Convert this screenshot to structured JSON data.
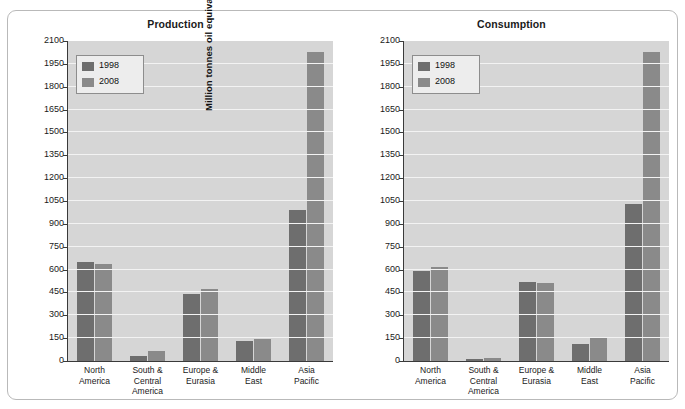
{
  "top_caption": "",
  "figure": {
    "panels": [
      {
        "title": "Production",
        "ylabel": "Million tonnes oil equivalent"
      },
      {
        "title": "Consumption",
        "ylabel": "Million tonnes oil equivalent"
      }
    ],
    "legend": {
      "items": [
        {
          "label": "1998",
          "color": "#6e6e6e"
        },
        {
          "label": "2008",
          "color": "#8a8a8a"
        }
      ]
    },
    "y_ticks": [
      "0",
      "150",
      "300",
      "450",
      "600",
      "750",
      "900",
      "1050",
      "1200",
      "1350",
      "1500",
      "1650",
      "1800",
      "1950",
      "2100"
    ],
    "categories": [
      "North\nAmerica",
      "South &\nCentral\nAmerica",
      "Europe &\nEurasia",
      "Middle\nEast",
      "Asia\nPacific"
    ]
  },
  "chart_data": [
    {
      "type": "bar",
      "title": "Production",
      "xlabel": "",
      "ylabel": "Million tonnes oil equivalent",
      "ylim": [
        0,
        2100
      ],
      "ytick_step": 150,
      "grid": true,
      "legend_position": "top-left",
      "categories": [
        "North America",
        "South & Central America",
        "Europe & Eurasia",
        "Middle East",
        "Asia Pacific"
      ],
      "series": [
        {
          "name": "1998",
          "color": "#6e6e6e",
          "values": [
            650,
            30,
            440,
            130,
            990
          ]
        },
        {
          "name": "2008",
          "color": "#8a8a8a",
          "values": [
            635,
            65,
            470,
            145,
            2030
          ]
        }
      ]
    },
    {
      "type": "bar",
      "title": "Consumption",
      "xlabel": "",
      "ylabel": "Million tonnes oil equivalent",
      "ylim": [
        0,
        2100
      ],
      "ytick_step": 150,
      "grid": true,
      "legend_position": "top-left",
      "categories": [
        "North America",
        "South & Central America",
        "Europe & Eurasia",
        "Middle East",
        "Asia Pacific"
      ],
      "series": [
        {
          "name": "1998",
          "color": "#6e6e6e",
          "values": [
            590,
            15,
            520,
            110,
            1030
          ]
        },
        {
          "name": "2008",
          "color": "#8a8a8a",
          "values": [
            620,
            20,
            515,
            155,
            2030
          ]
        }
      ]
    }
  ]
}
